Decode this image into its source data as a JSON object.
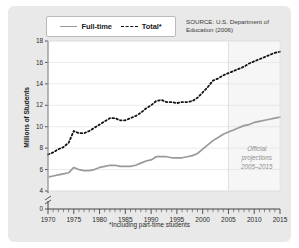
{
  "card": {
    "background": "#e9e9e9",
    "plot_background": "#ffffff"
  },
  "legend": {
    "position": "top-left-inside",
    "items": [
      {
        "label": "Full-time",
        "style": "solid",
        "color": "#9a9a9a",
        "icon": "line-solid-icon"
      },
      {
        "label": "Total*",
        "style": "dashed",
        "color": "#111111",
        "icon": "line-dashed-icon"
      }
    ]
  },
  "source_note": {
    "line1": "SOURCE: U.S. Department of",
    "line2": "Education (2006)"
  },
  "footnote": "*Including part-time students",
  "annotation": {
    "line1": "Official",
    "line2": "projections",
    "line3": "2005–2015",
    "color": "#8e8e8e",
    "start_year": 2005
  },
  "axes": {
    "y_label": "Millions of Students",
    "y_ticks": [
      0,
      4,
      6,
      8,
      10,
      12,
      14,
      16,
      18
    ],
    "y_axis_break": true,
    "y_break_between": [
      0,
      4
    ],
    "x_ticks": [
      1970,
      1975,
      1980,
      1985,
      1990,
      1995,
      2000,
      2005,
      2010,
      2015
    ],
    "x_minor_tick_interval": 1,
    "gridlines": "horizontal"
  },
  "chart_data": {
    "type": "line",
    "title": "",
    "xlabel": "",
    "ylabel": "Millions of Students",
    "xlim": [
      1970,
      2015
    ],
    "ylim": [
      4,
      18
    ],
    "ylim_display": [
      0,
      18
    ],
    "grid": true,
    "legend_position": "top-left",
    "annotations": [
      {
        "text": "Official projections 2005–2015",
        "x": 2010,
        "y": 6.8
      },
      {
        "text": "*Including part-time students",
        "x": null,
        "y": null
      }
    ],
    "x": [
      1970,
      1971,
      1972,
      1973,
      1974,
      1975,
      1976,
      1977,
      1978,
      1979,
      1980,
      1981,
      1982,
      1983,
      1984,
      1985,
      1986,
      1987,
      1988,
      1989,
      1990,
      1991,
      1992,
      1993,
      1994,
      1995,
      1996,
      1997,
      1998,
      1999,
      2000,
      2001,
      2002,
      2003,
      2004,
      2005,
      2006,
      2007,
      2008,
      2009,
      2010,
      2011,
      2012,
      2013,
      2014,
      2015
    ],
    "series": [
      {
        "name": "Total*",
        "style": "dashed",
        "color": "#111111",
        "values": [
          7.4,
          7.6,
          7.9,
          8.1,
          8.5,
          9.6,
          9.4,
          9.4,
          9.6,
          9.9,
          10.2,
          10.5,
          10.8,
          10.8,
          10.6,
          10.6,
          10.8,
          11.0,
          11.3,
          11.7,
          12.0,
          12.4,
          12.5,
          12.3,
          12.3,
          12.2,
          12.3,
          12.3,
          12.4,
          12.7,
          13.2,
          13.7,
          14.3,
          14.5,
          14.8,
          15.0,
          15.2,
          15.4,
          15.6,
          15.9,
          16.1,
          16.3,
          16.5,
          16.7,
          16.9,
          17.0
        ]
      },
      {
        "name": "Full-time",
        "style": "solid",
        "color": "#9a9a9a",
        "values": [
          5.3,
          5.4,
          5.5,
          5.6,
          5.7,
          6.2,
          6.0,
          5.9,
          5.9,
          6.0,
          6.2,
          6.3,
          6.4,
          6.4,
          6.3,
          6.3,
          6.3,
          6.4,
          6.6,
          6.8,
          6.9,
          7.2,
          7.2,
          7.2,
          7.1,
          7.1,
          7.1,
          7.2,
          7.3,
          7.5,
          7.9,
          8.3,
          8.7,
          9.0,
          9.3,
          9.5,
          9.7,
          9.9,
          10.1,
          10.2,
          10.4,
          10.5,
          10.6,
          10.7,
          10.8,
          10.9
        ]
      }
    ]
  }
}
